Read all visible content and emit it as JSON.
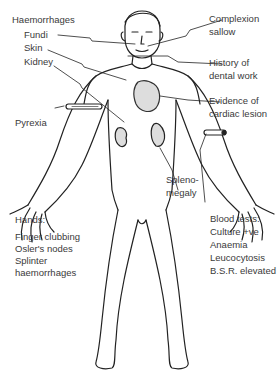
{
  "labels": {
    "haemorrhages": "Haemorrhages",
    "fundi": "Fundi",
    "skin": "Skin",
    "kidney": "Kidney",
    "complexion_1": "Complexion",
    "complexion_2": "sallow",
    "dental_1": "History of",
    "dental_2": "dental work",
    "cardiac_1": "Evidence of",
    "cardiac_2": "cardiac lesion",
    "pyrexia": "Pyrexia",
    "spleno_1": "Spleno-",
    "spleno_2": "megaly",
    "hands_title": "Hands:",
    "hands_1": "Finger clubbing",
    "hands_2": "Osler's nodes",
    "hands_3": "Splinter",
    "hands_4": "haemorrhages",
    "blood_title": "Blood tests:",
    "blood_1": "Culture +ve",
    "blood_2": "Anaemia",
    "blood_3": "Leucocytosis",
    "blood_4": "B.S.R. elevated"
  }
}
